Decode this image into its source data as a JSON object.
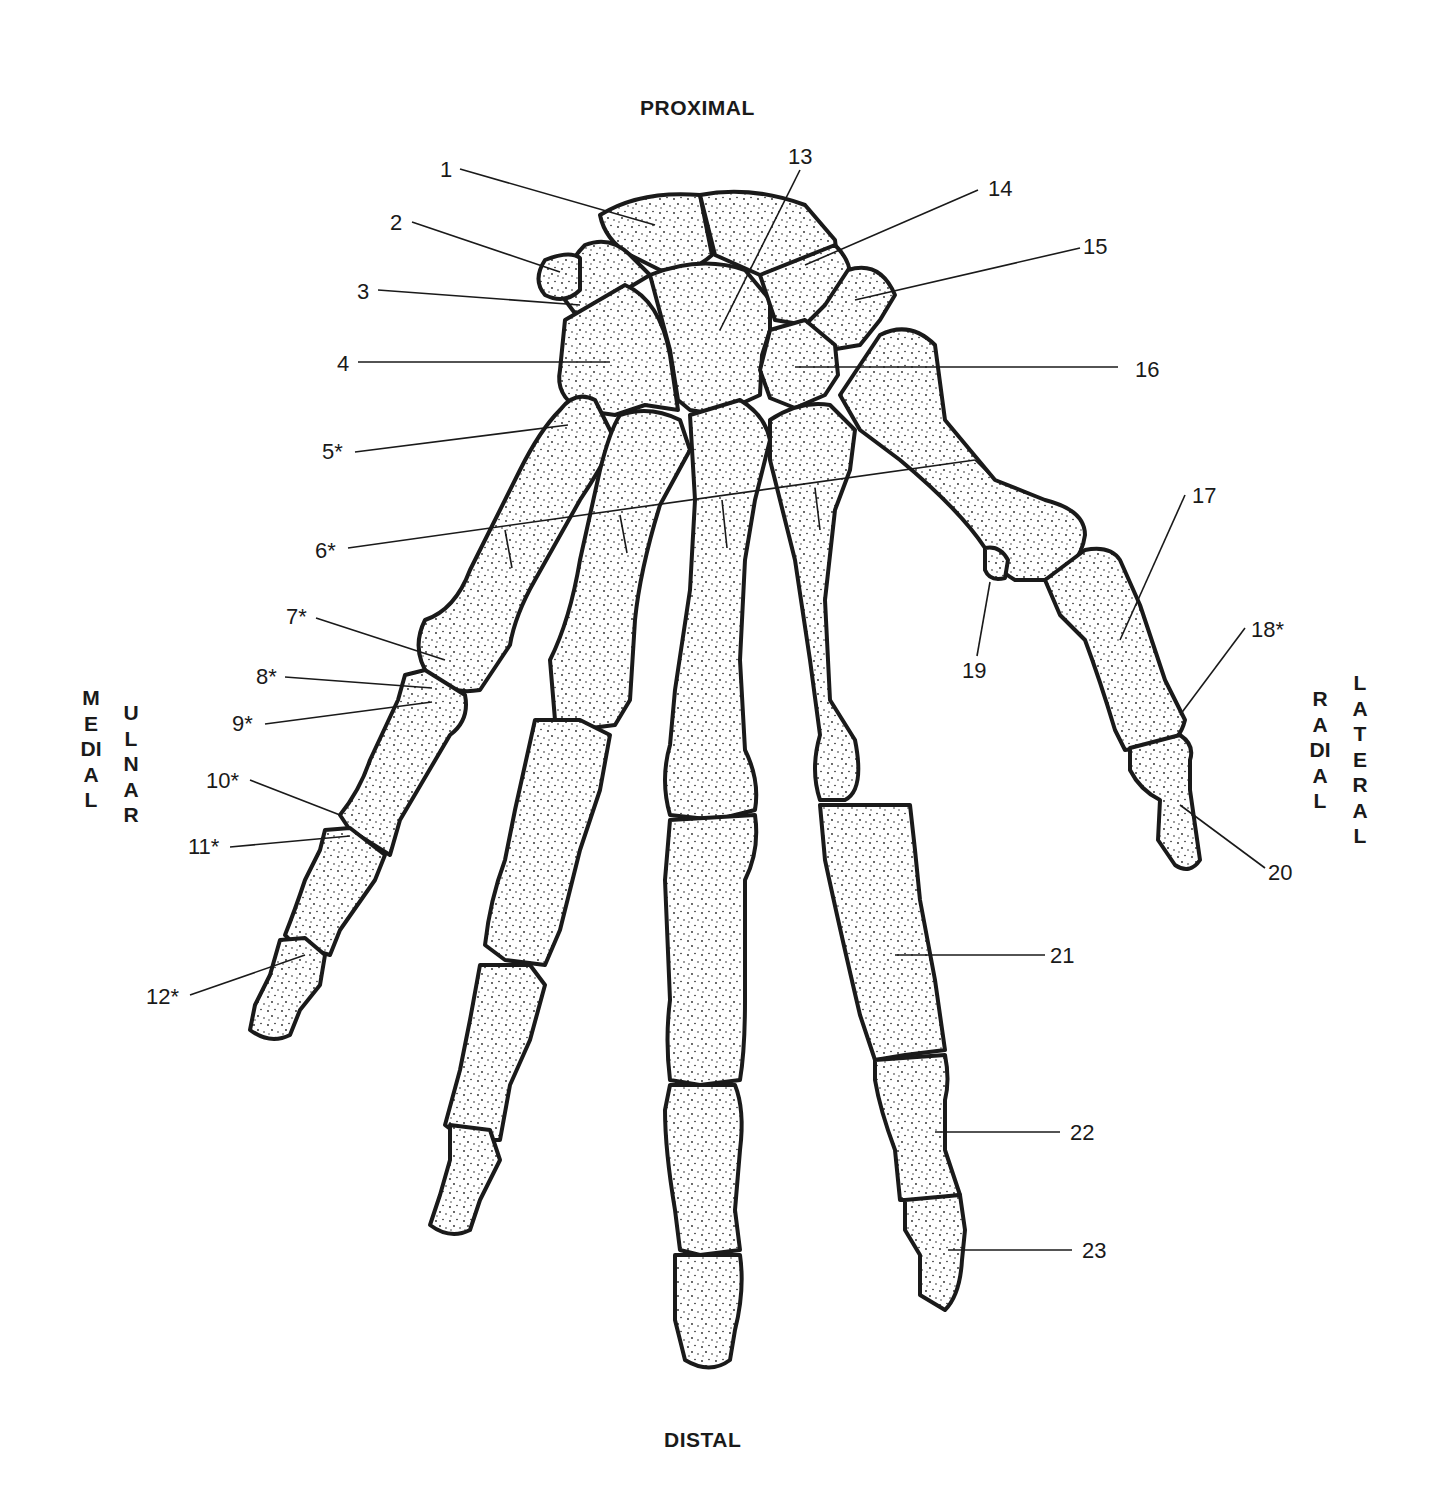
{
  "orientation": {
    "top": "PROXIMAL",
    "bottom": "DISTAL",
    "left_outer": "MEDIAL",
    "left_inner": "ULNAR",
    "right_inner": "RADIAL",
    "right_outer": "LATERAL"
  },
  "labels": [
    {
      "id": 1,
      "text": "1"
    },
    {
      "id": 2,
      "text": "2"
    },
    {
      "id": 3,
      "text": "3"
    },
    {
      "id": 4,
      "text": "4"
    },
    {
      "id": 5,
      "text": "5*"
    },
    {
      "id": 6,
      "text": "6*"
    },
    {
      "id": 7,
      "text": "7*"
    },
    {
      "id": 8,
      "text": "8*"
    },
    {
      "id": 9,
      "text": "9*"
    },
    {
      "id": 10,
      "text": "10*"
    },
    {
      "id": 11,
      "text": "11*"
    },
    {
      "id": 12,
      "text": "12*"
    },
    {
      "id": 13,
      "text": "13"
    },
    {
      "id": 14,
      "text": "14"
    },
    {
      "id": 15,
      "text": "15"
    },
    {
      "id": 16,
      "text": "16"
    },
    {
      "id": 17,
      "text": "17"
    },
    {
      "id": 18,
      "text": "18*"
    },
    {
      "id": 19,
      "text": "19"
    },
    {
      "id": 20,
      "text": "20"
    },
    {
      "id": 21,
      "text": "21"
    },
    {
      "id": 22,
      "text": "22"
    },
    {
      "id": 23,
      "text": "23"
    }
  ],
  "colors": {
    "ink": "#1a1a1a",
    "bone_fill": "#ffffff",
    "background": "#ffffff"
  }
}
